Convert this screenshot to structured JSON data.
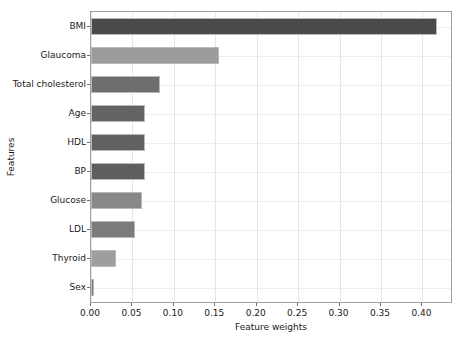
{
  "chart_data": {
    "type": "bar",
    "orientation": "horizontal",
    "title": "",
    "xlabel": "Feature weights",
    "ylabel": "Features",
    "categories": [
      "BMI",
      "Glaucoma",
      "Total cholesterol",
      "Age",
      "HDL",
      "BP",
      "Glucose",
      "LDL",
      "Thyroid",
      "Sex"
    ],
    "values": [
      0.418,
      0.154,
      0.083,
      0.065,
      0.065,
      0.065,
      0.061,
      0.053,
      0.03,
      0.004
    ],
    "bar_colors": [
      "#4a4a4a",
      "#9b9b9b",
      "#6e6e6e",
      "#636363",
      "#616161",
      "#5e5e5e",
      "#888888",
      "#7b7b7b",
      "#9e9e9e",
      "#787878"
    ],
    "xlim": [
      0.0,
      0.4345
    ],
    "xticks": [
      0.0,
      0.05,
      0.1,
      0.15,
      0.2,
      0.25,
      0.3,
      0.35,
      0.4
    ],
    "xtick_labels": [
      "0.00",
      "0.05",
      "0.10",
      "0.15",
      "0.20",
      "0.25",
      "0.30",
      "0.35",
      "0.40"
    ],
    "grid": true,
    "grid_axis": "both",
    "legend": false,
    "legend_position": "none"
  }
}
